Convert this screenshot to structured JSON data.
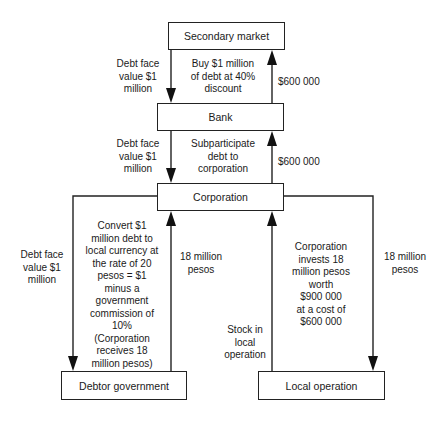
{
  "diagram": {
    "nodes": {
      "secondary_market": "Secondary market",
      "bank": "Bank",
      "corporation": "Corporation",
      "debtor_government": "Debtor government",
      "local_operation": "Local operation"
    },
    "edges": {
      "market_to_bank_left": [
        "Debt face",
        "value $1",
        "million"
      ],
      "market_to_bank_mid": [
        "Buy $1 million",
        "of debt at 40%",
        "discount"
      ],
      "bank_to_market_right": "$600 000",
      "bank_to_corp_left": [
        "Debt face",
        "value $1",
        "million"
      ],
      "bank_to_corp_mid": [
        "Subparticipate",
        "debt to",
        "corporation"
      ],
      "corp_to_bank_right": "$600 000",
      "corp_to_gov_left": [
        "Debt face",
        "value $1",
        "million"
      ],
      "corp_to_gov_mid": [
        "Convert $1",
        "million debt to",
        "local currency at",
        "the rate of 20",
        "pesos = $1",
        "minus a",
        "government",
        "commission of",
        "10%",
        "(Corporation",
        "receives 18",
        "million pesos)"
      ],
      "gov_to_corp": [
        "18 million",
        "pesos"
      ],
      "local_to_corp_left": [
        "Stock in",
        "local",
        "operation"
      ],
      "local_to_corp_mid": [
        "Corporation",
        "invests 18",
        "million pesos",
        "worth",
        "$900 000",
        "at a cost of",
        "$600 000"
      ],
      "corp_to_local_right": [
        "18 million",
        "pesos"
      ]
    }
  }
}
